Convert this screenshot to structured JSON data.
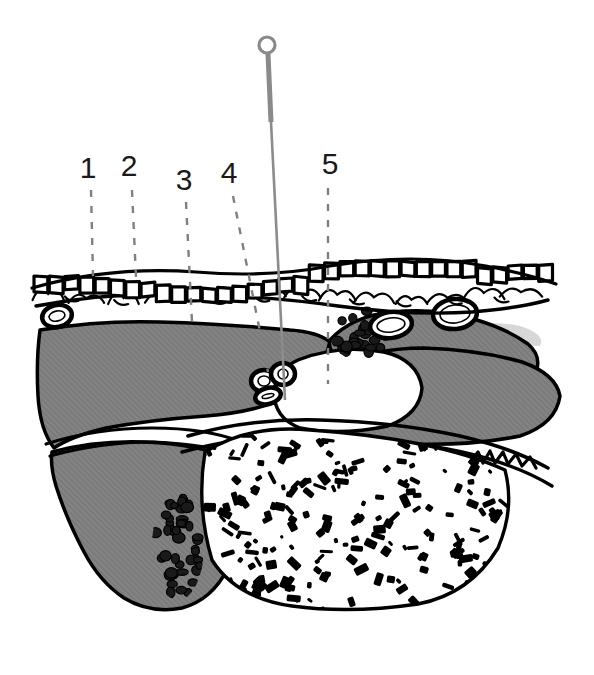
{
  "figure": {
    "type": "anatomical-cross-section",
    "title": "",
    "background_color": "#ffffff",
    "width": 594,
    "height": 675,
    "colors": {
      "ink": "#000000",
      "tissue_gray": "#808080",
      "needle_gray": "#8a8a8a",
      "leader_gray": "#808080",
      "label_text": "#1a1a1a",
      "faint_gray": "#c9c9c9"
    }
  },
  "labels": [
    {
      "id": "1",
      "text": "1",
      "text_x": 88,
      "text_y": 178,
      "leader": {
        "x1": 91,
        "y1": 190,
        "x2": 93,
        "y2": 276
      }
    },
    {
      "id": "2",
      "text": "2",
      "text_x": 129,
      "text_y": 176,
      "leader": {
        "x1": 132,
        "y1": 190,
        "x2": 136,
        "y2": 277
      }
    },
    {
      "id": "3",
      "text": "3",
      "text_x": 184,
      "text_y": 190,
      "leader": {
        "x1": 186,
        "y1": 202,
        "x2": 194,
        "y2": 362
      }
    },
    {
      "id": "4",
      "text": "4",
      "text_x": 229,
      "text_y": 183,
      "leader": {
        "x1": 233,
        "y1": 196,
        "x2": 268,
        "y2": 372
      }
    },
    {
      "id": "5",
      "text": "5",
      "text_x": 330,
      "text_y": 174,
      "leader": {
        "x1": 328,
        "y1": 188,
        "x2": 328,
        "y2": 384
      }
    }
  ],
  "needle": {
    "name": "insertion-needle",
    "ring_center_x": 267,
    "ring_center_y": 45,
    "ring_radius": 8,
    "shaft_upper": {
      "x1": 268,
      "y1": 54,
      "x2": 271,
      "y2": 122
    },
    "shaft_lower": {
      "x1": 271,
      "y1": 122,
      "x2": 285,
      "y2": 400
    },
    "tip_y": 400
  },
  "epidermis": {
    "name": "epidermis-band",
    "description": "brick-like keratinocyte cell row",
    "y_top": 262,
    "y_bottom": 292,
    "cell_count": 34
  },
  "subcutaneous": {
    "name": "subcutaneous-layer",
    "description": "loose wavy connective tissue lobules",
    "y_top": 288,
    "y_bottom": 318
  },
  "vessels": [
    {
      "name": "vessel-left",
      "cx": 57,
      "cy": 316,
      "rx": 15,
      "ry": 11,
      "rotate": -12
    },
    {
      "name": "vessel-mid",
      "cx": 391,
      "cy": 325,
      "rx": 21,
      "ry": 13,
      "rotate": -8
    },
    {
      "name": "vessel-right",
      "cx": 455,
      "cy": 314,
      "rx": 22,
      "ry": 15,
      "rotate": -6
    },
    {
      "name": "vessel-small-a",
      "cx": 264,
      "cy": 381,
      "rx": 13,
      "ry": 11,
      "rotate": 0
    },
    {
      "name": "vessel-small-b",
      "cx": 283,
      "cy": 374,
      "rx": 12,
      "ry": 11,
      "rotate": 0
    },
    {
      "name": "vessel-small-c",
      "cx": 268,
      "cy": 396,
      "rx": 13,
      "ry": 8,
      "rotate": -14
    }
  ],
  "granular_clusters": [
    {
      "name": "granular-cluster-upper",
      "cx": 366,
      "cy": 334,
      "rx": 34,
      "ry": 26,
      "count": 34
    },
    {
      "name": "granular-cluster-lower-left",
      "cx": 178,
      "cy": 546,
      "rx": 24,
      "ry": 52,
      "count": 46
    }
  ],
  "trabecular_bone": {
    "name": "trabecular-bone",
    "description": "cancellous bone with dense stipple trabeculae",
    "bounds": {
      "x": 200,
      "y": 430,
      "width": 310,
      "height": 180
    },
    "stipple_count": 230
  },
  "tissue_masses": [
    {
      "name": "tissue-mass-left-superficial"
    },
    {
      "name": "tissue-mass-right-superficial"
    },
    {
      "name": "tissue-mass-lower-left"
    },
    {
      "name": "tissue-mass-right-deep"
    }
  ],
  "joint_space": {
    "name": "joint-space",
    "description": "white articular cavity where needle tip terminates"
  }
}
